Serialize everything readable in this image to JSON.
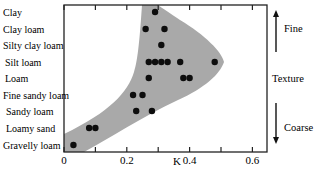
{
  "chart_data": {
    "type": "scatter",
    "title": "",
    "xlabel": "K",
    "ylabel": "",
    "xlim": [
      0,
      0.65
    ],
    "x_ticks": [
      0,
      0.1,
      0.2,
      0.3,
      0.4,
      0.5,
      0.6
    ],
    "x_tick_labels": [
      "0",
      "",
      "0.2",
      "",
      "0.4",
      "",
      "0.6"
    ],
    "categories": [
      "Clay",
      "Clay loam",
      "Silty clay loam",
      "Silt loam",
      "Loam",
      "Fine sandy loam",
      "Sandy loam",
      "Loamy sand",
      "Gravelly loam"
    ],
    "grid": false,
    "legend": "none",
    "points": [
      {
        "category": "Clay",
        "K": [
          0.29
        ]
      },
      {
        "category": "Clay loam",
        "K": [
          0.26,
          0.32
        ]
      },
      {
        "category": "Silty clay loam",
        "K": [
          0.31
        ]
      },
      {
        "category": "Silt loam",
        "K": [
          0.27,
          0.29,
          0.31,
          0.33,
          0.37,
          0.48
        ]
      },
      {
        "category": "Loam",
        "K": [
          0.27,
          0.38,
          0.4
        ]
      },
      {
        "category": "Fine sandy loam",
        "K": [
          0.22,
          0.25
        ]
      },
      {
        "category": "Sandy loam",
        "K": [
          0.23,
          0.28
        ]
      },
      {
        "category": "Loamy sand",
        "K": [
          0.08,
          0.1
        ]
      },
      {
        "category": "Gravelly loam",
        "K": [
          0.03
        ]
      }
    ],
    "shaded_envelope": "grey band enclosing the K range per texture class, widest at Silt loam (~0.24–0.51), narrowing toward Clay (~0.25–0.30) and Gravelly loam (~0–0.07)",
    "annotations": {
      "axis_title_right": "Texture",
      "arrow_up_label": "Fine",
      "arrow_down_label": "Coarse"
    }
  },
  "colors": {
    "envelope_fill": "#a9a9a9",
    "points": "#0d0d0d",
    "frame": "#222222"
  }
}
